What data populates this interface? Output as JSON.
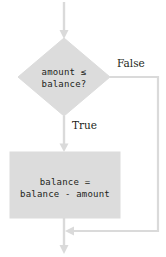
{
  "diagram": {
    "type": "flowchart",
    "title": "",
    "colors": {
      "shape_fill": "#dcdcdc",
      "shape_stroke": "#dcdcdc",
      "line": "#d9d9d9",
      "text": "#231f20",
      "background": "#ffffff"
    },
    "nodes": [
      {
        "id": "decision",
        "shape": "diamond",
        "name": "decision-amount-le-balance",
        "text_line1": "amount ≤",
        "text_line2": "balance?"
      },
      {
        "id": "process",
        "shape": "rectangle",
        "name": "process-subtract-amount",
        "text_line1": "balance =",
        "text_line2": "balance - amount"
      }
    ],
    "edges": [
      {
        "id": "entry",
        "name": "entry-arrow",
        "from": "",
        "to": "decision",
        "label": ""
      },
      {
        "id": "true-branch",
        "name": "true-branch-arrow",
        "from": "decision",
        "to": "process",
        "label": "True"
      },
      {
        "id": "false-branch",
        "name": "false-branch-arrow",
        "from": "decision",
        "to": "merge",
        "label": "False"
      },
      {
        "id": "process-out",
        "name": "process-exit-arrow",
        "from": "process",
        "to": "merge",
        "label": ""
      },
      {
        "id": "exit",
        "name": "exit-arrow",
        "from": "merge",
        "to": "",
        "label": ""
      }
    ],
    "labels": {
      "false": "False",
      "true": "True"
    }
  }
}
